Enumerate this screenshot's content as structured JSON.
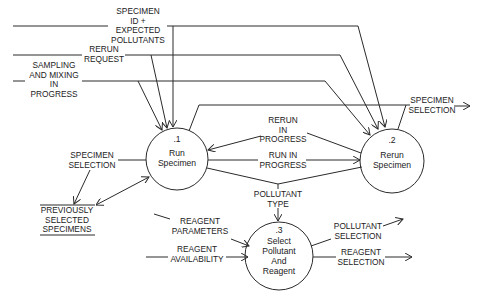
{
  "diagram": {
    "type": "data-flow-diagram",
    "processes": [
      {
        "id": "p1",
        "number": ".1",
        "name": "Run\nSpecimen"
      },
      {
        "id": "p2",
        "number": ".2",
        "name": "Rerun\nSpecimen"
      },
      {
        "id": "p3",
        "number": ".3",
        "name": "Select\nPollutant\nAnd\nReagent"
      }
    ],
    "data_store": {
      "name": "PREVIOUSLY\nSELECTED\nSPECIMENS"
    },
    "flows": {
      "specimen_id": "SPECIMEN\nID +\nEXPECTED\nPOLLUTANTS",
      "rerun_request": "RERUN\nREQUEST",
      "sampling": "SAMPLING\nAND MIXING\nIN\nPROGRESS",
      "specimen_selection_out": "SPECIMEN\nSELECTION",
      "rerun_in_progress": "RERUN\nIN\nPROGRESS",
      "run_in_progress": "RUN IN\nPROGRESS",
      "specimen_selection_left": "SPECIMEN\nSELECTION",
      "pollutant_type": "POLLUTANT\nTYPE",
      "reagent_parameters": "REAGENT\nPARAMETERS",
      "reagent_availability": "REAGENT\nAVAILABILITY",
      "pollutant_selection": "POLLUTANT\nSELECTION",
      "reagent_selection": "REAGENT\nSELECTION"
    },
    "colors": {
      "line": "#2a2a2a",
      "text": "#222222",
      "background": "#ffffff"
    }
  }
}
